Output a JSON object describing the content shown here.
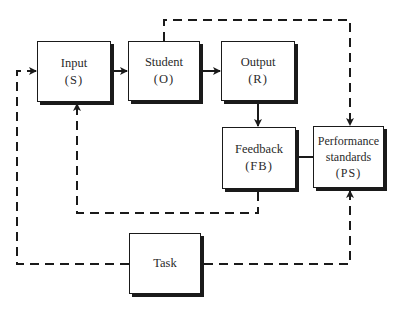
{
  "diagram": {
    "boxes": [
      {
        "id": "input",
        "label": "Input",
        "abbr": "(S)"
      },
      {
        "id": "student",
        "label": "Student",
        "abbr": "(O)"
      },
      {
        "id": "output",
        "label": "Output",
        "abbr": "(R)"
      },
      {
        "id": "feedback",
        "label": "Feedback",
        "abbr": "(FB)"
      },
      {
        "id": "performance-standards",
        "label_line1": "Performance",
        "label_line2": "standards",
        "abbr": "(PS)"
      },
      {
        "id": "task",
        "label": "Task"
      }
    ],
    "connections": [
      {
        "from": "input",
        "to": "student",
        "style": "solid",
        "arrow": true
      },
      {
        "from": "student",
        "to": "output",
        "style": "solid",
        "arrow": true
      },
      {
        "from": "output",
        "to": "feedback",
        "style": "solid",
        "arrow": true
      },
      {
        "from": "feedback",
        "to": "performance-standards",
        "style": "solid",
        "arrow": false
      },
      {
        "from": "student",
        "to": "performance-standards",
        "style": "dashed",
        "arrow": true
      },
      {
        "from": "feedback",
        "to": "input",
        "style": "dashed",
        "arrow": true
      },
      {
        "from": "task",
        "to": "input",
        "style": "dashed",
        "arrow": true
      },
      {
        "from": "task",
        "to": "performance-standards",
        "style": "dashed",
        "arrow": true
      }
    ],
    "colors": {
      "line": "#1a1a1a",
      "text": "#2a2a2a",
      "background": "#ffffff"
    }
  }
}
